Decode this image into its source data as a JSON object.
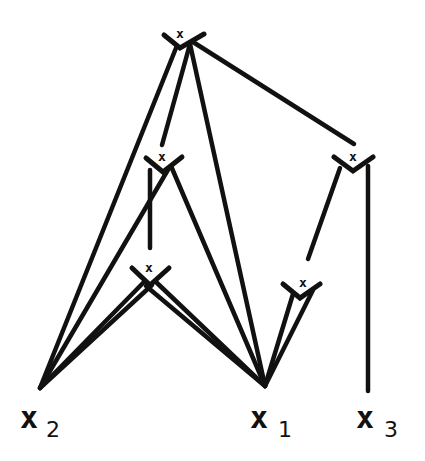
{
  "diagram": {
    "type": "tree",
    "colors": {
      "ink": "#111111",
      "background": "#ffffff"
    },
    "nodes": [
      {
        "id": "top",
        "label": "x",
        "x": 183,
        "y": 40
      },
      {
        "id": "mid_left",
        "label": "x",
        "x": 160,
        "y": 164
      },
      {
        "id": "mid_right",
        "label": "x",
        "x": 352,
        "y": 163
      },
      {
        "id": "low_left",
        "label": "x",
        "x": 148,
        "y": 280
      },
      {
        "id": "low_right",
        "label": "x",
        "x": 302,
        "y": 293
      }
    ],
    "leaves": [
      {
        "id": "x2",
        "base": "x",
        "subscript": "2",
        "x": 40,
        "y": 388
      },
      {
        "id": "x1",
        "base": "x",
        "subscript": "1",
        "x": 265,
        "y": 386
      },
      {
        "id": "x3",
        "base": "x",
        "subscript": "3",
        "x": 368,
        "y": 388
      }
    ],
    "edges": [
      {
        "from": "top",
        "to": "x2"
      },
      {
        "from": "top",
        "to": "mid_left"
      },
      {
        "from": "top",
        "to": "x1"
      },
      {
        "from": "top",
        "to": "mid_right"
      },
      {
        "from": "mid_left",
        "to": "x2"
      },
      {
        "from": "mid_left",
        "to": "x1"
      },
      {
        "from": "mid_left",
        "to": "low_left"
      },
      {
        "from": "low_left",
        "to": "x2"
      },
      {
        "from": "low_left",
        "to": "x1"
      },
      {
        "from": "mid_right",
        "to": "low_right"
      },
      {
        "from": "mid_right",
        "to": "x3"
      },
      {
        "from": "low_right",
        "to": "x1"
      }
    ]
  },
  "labels": {
    "node_top": "x",
    "node_mid_left": "x",
    "node_mid_right": "x",
    "node_low_left": "x",
    "node_low_right": "x",
    "leaf_x2_base": "x",
    "leaf_x2_sub": "2",
    "leaf_x1_base": "x",
    "leaf_x1_sub": "1",
    "leaf_x3_base": "x",
    "leaf_x3_sub": "3"
  }
}
